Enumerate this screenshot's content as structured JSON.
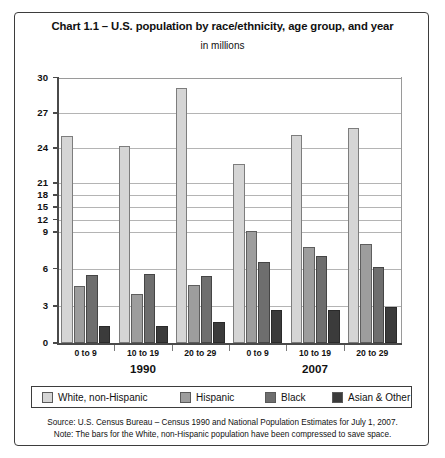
{
  "chart_data": {
    "type": "bar",
    "title": "Chart 1.1 – U.S. population by race/ethnicity, age group, and year",
    "subtitle": "in millions",
    "xlabel": "",
    "ylabel": "",
    "ylim": [
      0,
      30
    ],
    "yticks": [
      0,
      3,
      6,
      9,
      12,
      15,
      18,
      21,
      24,
      27,
      30
    ],
    "grid": true,
    "legend_position": "bottom",
    "axis_note": "compressed (broken) y-axis between 9 and 21",
    "groups": [
      "1990",
      "2007"
    ],
    "categories": [
      "0 to 9",
      "10 to 19",
      "20 to 29",
      "0 to 9",
      "10 to 19",
      "20 to 29"
    ],
    "series": [
      {
        "name": "White, non-Hispanic",
        "color": "#d5d5d5",
        "values": [
          25.0,
          24.2,
          29.1,
          22.6,
          25.1,
          25.7
        ]
      },
      {
        "name": "Hispanic",
        "color": "#9d9d9d",
        "values": [
          4.6,
          4.0,
          4.7,
          9.3,
          7.8,
          8.0
        ]
      },
      {
        "name": "Black",
        "color": "#6e6e6e",
        "values": [
          5.5,
          5.6,
          5.4,
          6.5,
          7.0,
          6.1
        ]
      },
      {
        "name": "Asian & Other",
        "color": "#3b3b3b",
        "values": [
          1.4,
          1.4,
          1.7,
          2.7,
          2.7,
          2.9
        ]
      }
    ],
    "source_note": "Source: U.S. Census Bureau – Census 1990 and National Population Estimates for July 1, 2007.",
    "method_note": "Note: The bars for the White, non-Hispanic population have been compressed to save space."
  },
  "axis": {
    "labels": [
      "30",
      "27",
      "24",
      "21",
      "18",
      "15",
      "12",
      "9",
      "6",
      "3",
      "0"
    ]
  },
  "categories": {
    "items": [
      "0 to 9",
      "10 to 19",
      "20 to 29",
      "0 to 9",
      "10 to 19",
      "20 to 29"
    ]
  },
  "years": {
    "items": [
      "1990",
      "2007"
    ]
  },
  "legend": {
    "items": [
      {
        "label": "White, non-Hispanic"
      },
      {
        "label": "Hispanic"
      },
      {
        "label": "Black"
      },
      {
        "label": "Asian & Other"
      }
    ]
  }
}
